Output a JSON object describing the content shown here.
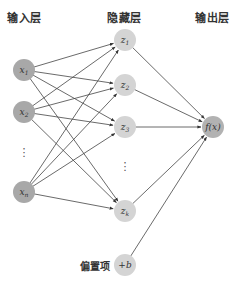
{
  "labels": {
    "input_layer": "输入层",
    "hidden_layer": "隐藏层",
    "output_layer": "输出层",
    "bias": "偏置项"
  },
  "colors": {
    "input_node": "#a8a8a8",
    "hidden_node": "#d4d4d4",
    "output_node": "#b2b2b2",
    "edge": "#444444"
  },
  "nodes": {
    "inputs": [
      {
        "id": "x1",
        "label": "x",
        "sub": "1",
        "cx": 24,
        "cy": 70
      },
      {
        "id": "x2",
        "label": "x",
        "sub": "2",
        "cx": 24,
        "cy": 112
      },
      {
        "id": "xn",
        "label": "x",
        "sub": "n",
        "cx": 24,
        "cy": 192
      }
    ],
    "hidden": [
      {
        "id": "z1",
        "label": "z",
        "sub": "1",
        "cx": 125,
        "cy": 40
      },
      {
        "id": "z2",
        "label": "z",
        "sub": "2",
        "cx": 125,
        "cy": 85
      },
      {
        "id": "z3",
        "label": "z",
        "sub": "3",
        "cx": 125,
        "cy": 127
      },
      {
        "id": "zk",
        "label": "z",
        "sub": "k",
        "cx": 125,
        "cy": 211
      }
    ],
    "bias": {
      "id": "b",
      "label": "+b",
      "cx": 125,
      "cy": 265
    },
    "output": {
      "id": "fx",
      "label": "f(x)",
      "cx": 213,
      "cy": 127
    }
  },
  "ellipsis": {
    "input": "⋮",
    "hidden": "⋮"
  }
}
